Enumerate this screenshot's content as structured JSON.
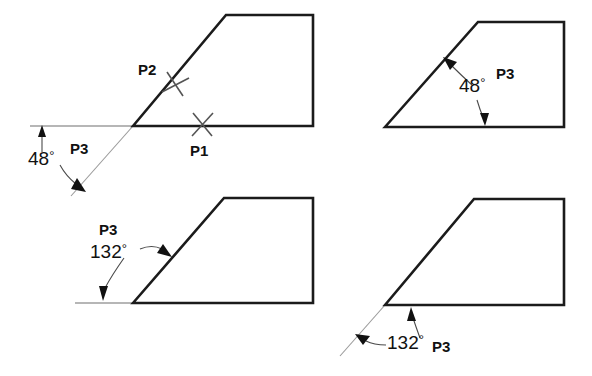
{
  "figure": {
    "stroke_color": "#1b1b1b",
    "thin_color": "#9a9a9a",
    "text_color": "#111111",
    "background": "#ffffff"
  },
  "panels": [
    {
      "id": "top-left",
      "name": "panel-top-left",
      "point_labels": [
        "P2",
        "P1"
      ],
      "angle_value": "48",
      "degree_symbol": "°",
      "point_label_p3": "P3"
    },
    {
      "id": "top-right",
      "name": "panel-top-right",
      "angle_value": "48",
      "degree_symbol": "°",
      "point_label_p3": "P3"
    },
    {
      "id": "bottom-left",
      "name": "panel-bottom-left",
      "angle_value": "132",
      "degree_symbol": "°",
      "point_label_p3": "P3"
    },
    {
      "id": "bottom-right",
      "name": "panel-bottom-right",
      "angle_value": "132",
      "degree_symbol": "°",
      "point_label_p3": "P3"
    }
  ],
  "labels": {
    "tl_p2": "P2",
    "tl_p1": "P1",
    "tl_angle": "48",
    "tl_p3": "P3",
    "tr_angle": "48",
    "tr_p3": "P3",
    "bl_p3": "P3",
    "bl_angle": "132",
    "br_angle": "132",
    "br_p3": "P3",
    "degree": "°"
  }
}
